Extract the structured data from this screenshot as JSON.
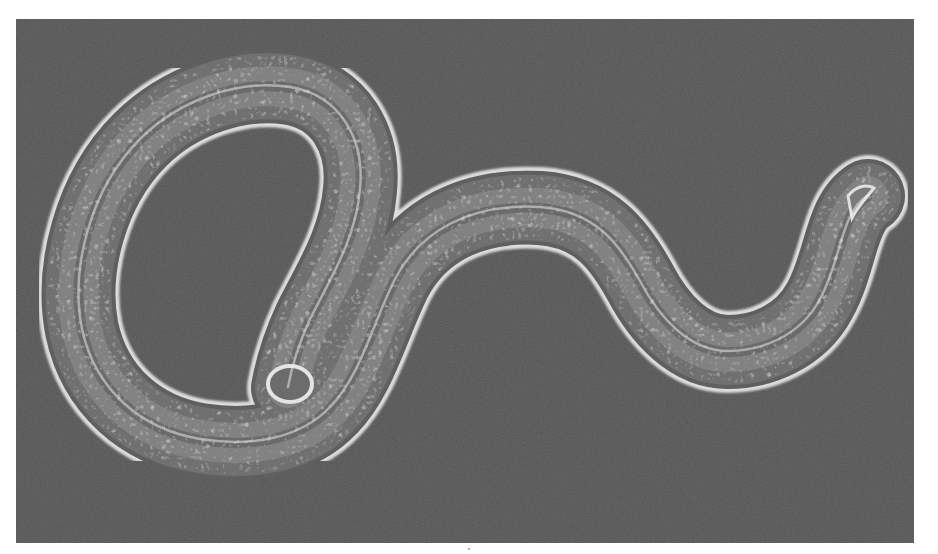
{
  "image": {
    "description": "Phase-contrast micrograph of a nematode worm (C. elegans-like) on a dark gray background",
    "subject": "nematode",
    "background_color": "#555555",
    "page_background": "#ffffff",
    "body_fill": "#6a6a6a",
    "rim_color": "#e6e6e6",
    "granule_color": "#bdbdbd"
  }
}
